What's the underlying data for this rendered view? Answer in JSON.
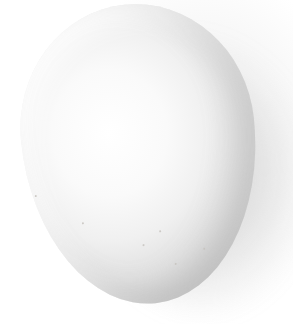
{
  "image": {
    "subject": "white egg",
    "background": "white",
    "colors": {
      "background": "#ffffff",
      "egg_highlight": "#ffffff",
      "egg_shade": "#d8d8d8",
      "shadow": "#b0b0b0"
    }
  }
}
